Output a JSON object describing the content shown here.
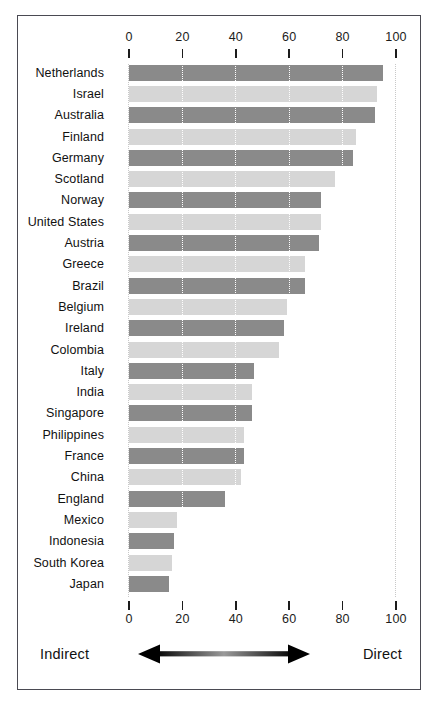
{
  "chart_data": {
    "type": "bar",
    "orientation": "horizontal",
    "title": "",
    "xlabel": "",
    "ylabel": "",
    "xlim": [
      0,
      100
    ],
    "xticks": [
      0,
      20,
      40,
      60,
      80,
      100
    ],
    "grid": true,
    "grid_axis": "x",
    "legend": "none",
    "axis_annotation": {
      "left_label": "Indirect",
      "right_label": "Direct",
      "arrow": "double-headed"
    },
    "categories": [
      "Netherlands",
      "Israel",
      "Australia",
      "Finland",
      "Germany",
      "Scotland",
      "Norway",
      "United States",
      "Austria",
      "Greece",
      "Brazil",
      "Belgium",
      "Ireland",
      "Colombia",
      "Italy",
      "India",
      "Singapore",
      "Philippines",
      "France",
      "China",
      "England",
      "Mexico",
      "Indonesia",
      "South Korea",
      "Japan"
    ],
    "values": [
      95,
      93,
      92,
      85,
      84,
      77,
      72,
      72,
      71,
      66,
      66,
      59,
      58,
      56,
      47,
      46,
      46,
      43,
      43,
      42,
      36,
      18,
      17,
      16,
      15
    ],
    "bar_colors": [
      "#8a8a8a",
      "#d6d6d6",
      "#8a8a8a",
      "#d6d6d6",
      "#8a8a8a",
      "#d6d6d6",
      "#8a8a8a",
      "#d6d6d6",
      "#8a8a8a",
      "#d6d6d6",
      "#8a8a8a",
      "#d6d6d6",
      "#8a8a8a",
      "#d6d6d6",
      "#8a8a8a",
      "#d6d6d6",
      "#8a8a8a",
      "#d6d6d6",
      "#8a8a8a",
      "#d6d6d6",
      "#8a8a8a",
      "#d6d6d6",
      "#8a8a8a",
      "#d6d6d6",
      "#8a8a8a"
    ],
    "colors": {
      "bar_dark": "#8a8a8a",
      "bar_light": "#d6d6d6",
      "gridline": "#ffffff",
      "border": "#4a4a52",
      "text": "#111111",
      "background": "#ffffff"
    }
  }
}
